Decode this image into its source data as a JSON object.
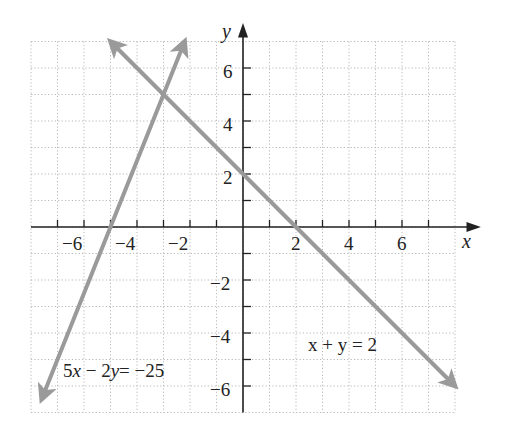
{
  "chart_data": {
    "type": "line",
    "title": "",
    "xlabel": "x",
    "ylabel": "y",
    "xlim": [
      -8,
      8
    ],
    "ylim": [
      -7,
      7
    ],
    "grid": true,
    "x_ticks": [
      -6,
      -4,
      -2,
      2,
      4,
      6
    ],
    "y_ticks": [
      6,
      4,
      2,
      -2,
      -4,
      -6
    ],
    "series": [
      {
        "name": "x + y = 2",
        "equation": "x + y = 2",
        "x": [
          -5,
          8
        ],
        "y": [
          7,
          -6
        ],
        "label_position": [
          2.6,
          -4.5
        ]
      },
      {
        "name": "5x - 2y = -25",
        "equation": "5x - 2y = -25",
        "x": [
          -7.6,
          -2.2
        ],
        "y": [
          -6.5,
          7
        ],
        "label_position": [
          -6.9,
          -5.6
        ]
      }
    ],
    "intersection": {
      "x": -3,
      "y": 5
    },
    "line_color": "#9a9a9a",
    "axis_color": "#222222",
    "grid_color": "#b8b8b8"
  },
  "labels": {
    "x_axis": "x",
    "y_axis": "y",
    "x_ticks": [
      "−6",
      "−4",
      "−2",
      "2",
      "4",
      "6"
    ],
    "y_ticks": [
      "6",
      "4",
      "2",
      "−2",
      "−4",
      "−6"
    ],
    "eq1": "x + y = 2",
    "eq2_a": "5",
    "eq2_b": "x",
    "eq2_c": " − 2",
    "eq2_d": "y",
    "eq2_e": "= −25"
  }
}
